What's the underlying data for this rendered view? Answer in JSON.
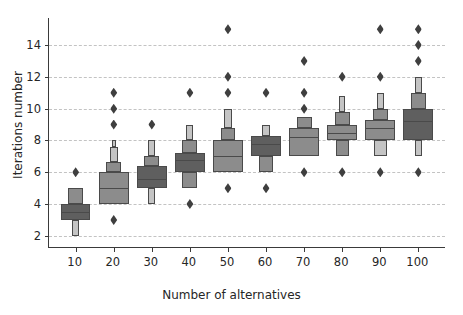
{
  "chart_data": {
    "type": "boxen",
    "title": "",
    "xlabel": "Number of alternatives",
    "ylabel": "Iterations number",
    "xtick_labels": [
      "10",
      "20",
      "30",
      "40",
      "50",
      "60",
      "70",
      "80",
      "90",
      "100"
    ],
    "ytick_labels": [
      "2",
      "4",
      "6",
      "8",
      "10",
      "12",
      "14"
    ],
    "ytick_values": [
      2,
      4,
      6,
      8,
      10,
      12,
      14
    ],
    "ylim": [
      1.3,
      15.7
    ],
    "xlim": [
      0.3,
      10.7
    ],
    "grid": "horizontal-dashed",
    "legend": "none",
    "box_fill_dark": "#5f5f5f",
    "box_fill_mid": "#8c8c8c",
    "box_fill_light": "#c4c4c4",
    "box_edge": "#4a4a4a",
    "outlier_color": "#3f3f3f",
    "background": "#ffffff",
    "categories": [
      {
        "x": "10",
        "median": 3.5,
        "levels": [
          {
            "lo": 3.0,
            "hi": 4.0,
            "width": 1.0,
            "shade": "dark"
          },
          {
            "lo": 4.0,
            "hi": 5.0,
            "width": 0.5,
            "shade": "mid"
          },
          {
            "lo": 2.0,
            "hi": 3.0,
            "width": 0.22,
            "shade": "light"
          }
        ],
        "outliers": [
          6
        ]
      },
      {
        "x": "20",
        "median": 5.0,
        "levels": [
          {
            "lo": 4.0,
            "hi": 6.0,
            "width": 1.0,
            "shade": "mid"
          },
          {
            "lo": 6.0,
            "hi": 6.65,
            "width": 0.52,
            "shade": "mid"
          },
          {
            "lo": 6.65,
            "hi": 7.6,
            "width": 0.26,
            "shade": "light"
          },
          {
            "lo": 7.6,
            "hi": 8.0,
            "width": 0.13,
            "shade": "light"
          }
        ],
        "outliers": [
          3,
          9,
          10,
          11
        ]
      },
      {
        "x": "30",
        "median": 5.6,
        "levels": [
          {
            "lo": 5.0,
            "hi": 6.4,
            "width": 1.0,
            "shade": "dark"
          },
          {
            "lo": 6.4,
            "hi": 7.0,
            "width": 0.5,
            "shade": "mid"
          },
          {
            "lo": 7.0,
            "hi": 8.0,
            "width": 0.24,
            "shade": "light"
          },
          {
            "lo": 4.0,
            "hi": 5.0,
            "width": 0.24,
            "shade": "light"
          }
        ],
        "outliers": [
          9
        ]
      },
      {
        "x": "40",
        "median": 6.8,
        "levels": [
          {
            "lo": 6.0,
            "hi": 7.2,
            "width": 1.0,
            "shade": "dark"
          },
          {
            "lo": 7.2,
            "hi": 8.0,
            "width": 0.5,
            "shade": "mid"
          },
          {
            "lo": 8.0,
            "hi": 9.0,
            "width": 0.24,
            "shade": "light"
          },
          {
            "lo": 5.0,
            "hi": 6.0,
            "width": 0.5,
            "shade": "mid"
          }
        ],
        "outliers": [
          4,
          11
        ]
      },
      {
        "x": "50",
        "median": 7.0,
        "levels": [
          {
            "lo": 6.0,
            "hi": 8.0,
            "width": 1.0,
            "shade": "mid"
          },
          {
            "lo": 8.0,
            "hi": 8.8,
            "width": 0.5,
            "shade": "mid"
          },
          {
            "lo": 8.8,
            "hi": 10.0,
            "width": 0.24,
            "shade": "light"
          }
        ],
        "outliers": [
          5,
          11,
          12,
          15
        ]
      },
      {
        "x": "60",
        "median": 7.8,
        "levels": [
          {
            "lo": 7.0,
            "hi": 8.3,
            "width": 1.0,
            "shade": "dark"
          },
          {
            "lo": 8.3,
            "hi": 9.0,
            "width": 0.28,
            "shade": "light"
          },
          {
            "lo": 6.0,
            "hi": 7.0,
            "width": 0.5,
            "shade": "mid"
          }
        ],
        "outliers": [
          5,
          11
        ]
      },
      {
        "x": "70",
        "median": 8.2,
        "levels": [
          {
            "lo": 7.0,
            "hi": 8.8,
            "width": 1.0,
            "shade": "mid"
          },
          {
            "lo": 8.8,
            "hi": 9.5,
            "width": 0.5,
            "shade": "mid"
          }
        ],
        "outliers": [
          6,
          10,
          11,
          13
        ]
      },
      {
        "x": "80",
        "median": 8.5,
        "levels": [
          {
            "lo": 8.0,
            "hi": 9.0,
            "width": 1.0,
            "shade": "mid"
          },
          {
            "lo": 9.0,
            "hi": 9.8,
            "width": 0.5,
            "shade": "mid"
          },
          {
            "lo": 9.8,
            "hi": 10.8,
            "width": 0.22,
            "shade": "light"
          },
          {
            "lo": 7.0,
            "hi": 8.0,
            "width": 0.44,
            "shade": "mid"
          }
        ],
        "outliers": [
          6,
          12
        ]
      },
      {
        "x": "90",
        "median": 8.8,
        "levels": [
          {
            "lo": 8.0,
            "hi": 9.3,
            "width": 1.0,
            "shade": "mid"
          },
          {
            "lo": 9.3,
            "hi": 10.0,
            "width": 0.5,
            "shade": "mid"
          },
          {
            "lo": 10.0,
            "hi": 11.0,
            "width": 0.22,
            "shade": "light"
          },
          {
            "lo": 7.0,
            "hi": 8.0,
            "width": 0.44,
            "shade": "light"
          }
        ],
        "outliers": [
          6,
          12,
          15
        ]
      },
      {
        "x": "100",
        "median": 9.2,
        "levels": [
          {
            "lo": 8.0,
            "hi": 10.0,
            "width": 1.0,
            "shade": "dark"
          },
          {
            "lo": 10.0,
            "hi": 11.0,
            "width": 0.5,
            "shade": "mid"
          },
          {
            "lo": 11.0,
            "hi": 12.0,
            "width": 0.22,
            "shade": "light"
          },
          {
            "lo": 7.0,
            "hi": 8.0,
            "width": 0.24,
            "shade": "light"
          }
        ],
        "outliers": [
          6,
          13,
          14,
          15
        ]
      }
    ]
  }
}
